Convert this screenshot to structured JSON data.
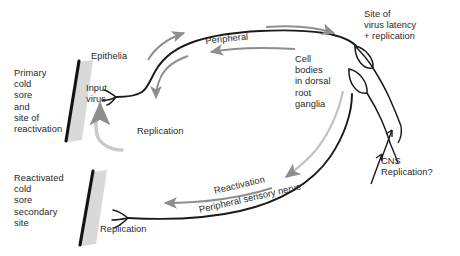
{
  "diagram": {
    "type": "biological-pathway-schematic",
    "background_color": "#ffffff",
    "ink_color": "#1a1a1a",
    "arrow_color": "#8e8e8e",
    "tissue_band_color": "#d7d7d7",
    "text_color": "#26282b"
  },
  "labels": {
    "primary_site": "Primary\ncold\nsore\nand\nsite of\nreactivation",
    "epithelia": "Epithelia",
    "input_virus": "Input\nvirus",
    "replication_top": "Replication",
    "peripheral": "Peripheral",
    "cell_bodies": "Cell\nbodies\nin dorsal\nroot\nganglia",
    "site_of_latency": "Site of\nvirus latency\n+ replication",
    "cns_replication": "CNS\nReplication?",
    "reactivation": "Reactivation",
    "peripheral_sensory_nerve": "Peripheral sensory nerve",
    "reactivated_site": "Reactivated\ncold\nsore\nsecondary\nsite",
    "replication_bottom": "Replication"
  },
  "structures": {
    "epithelium_slab_upper": "upper-epithelial-tissue-band",
    "epithelium_slab_lower": "lower-epithelial-tissue-band",
    "axon_upper": "upper-peripheral-sensory-axon",
    "axon_lower": "lower-peripheral-sensory-axon",
    "nerve_terminal_upper": "upper-nerve-terminal-branches",
    "nerve_terminal_lower": "lower-nerve-terminal-branches",
    "ganglion_cell_body_1": "dorsal-root-ganglion-cell-body-upper",
    "ganglion_cell_body_2": "dorsal-root-ganglion-cell-body-lower",
    "cns_branch_1": "cns-projection-branch-upper",
    "cns_branch_2": "cns-projection-branch-lower"
  },
  "flow_arrows": [
    {
      "name": "anterograde-to-ganglia",
      "label": "Peripheral",
      "direction": "rightward-along-upper-axon"
    },
    {
      "name": "retrograde-from-ganglia",
      "label": "",
      "direction": "leftward-along-upper-axon"
    },
    {
      "name": "virus-entry-to-epithelia",
      "label": "Replication",
      "direction": "upward-loop-into-epithelium"
    },
    {
      "name": "reactivation-down-nerve",
      "label": "Reactivation",
      "direction": "leftward-along-lower-axon"
    },
    {
      "name": "ganglia-to-lower-nerve",
      "label": "",
      "direction": "downward-left-from-ganglia"
    },
    {
      "name": "cns-input-upper",
      "label": "CNS Replication?",
      "direction": "up-toward-ganglia"
    },
    {
      "name": "cns-input-lower",
      "label": "CNS Replication?",
      "direction": "up-toward-ganglia"
    }
  ]
}
